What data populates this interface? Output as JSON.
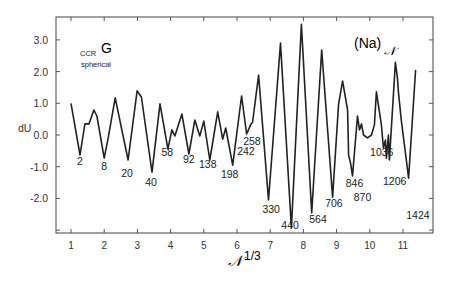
{
  "chart_data": {
    "type": "line",
    "title": "",
    "xlabel": "N^(1/3)",
    "xlabel_main": "𝒩",
    "xlabel_sup": "1/3",
    "ylabel": "dU",
    "xlim": [
      0.55,
      11.9
    ],
    "ylim": [
      -3.1,
      3.7
    ],
    "grid": false,
    "x_ticks": [
      1,
      2,
      3,
      4,
      5,
      6,
      7,
      8,
      9,
      10,
      11
    ],
    "x_tick_labels": [
      "1",
      "2",
      "3",
      "4",
      "5",
      "6",
      "7",
      "8",
      "9",
      "10",
      "11"
    ],
    "y_ticks": [
      3.0,
      2.0,
      1.0,
      0.0,
      -1.0,
      -2.0
    ],
    "y_tick_labels": [
      "3.0",
      "2.0",
      "1.0",
      "0.0",
      "-1.0",
      "-2.0"
    ],
    "annotations": {
      "model_main": "G",
      "model_sub": "CCR",
      "model_line2": "spherical",
      "system_main": "(Na)",
      "system_sub": "𝒩"
    },
    "series": [
      {
        "name": "dU",
        "x": [
          1.0,
          1.27,
          1.42,
          1.54,
          1.69,
          1.78,
          2.0,
          2.12,
          2.33,
          2.72,
          2.99,
          3.12,
          3.44,
          3.68,
          3.92,
          4.04,
          4.13,
          4.34,
          4.55,
          4.73,
          4.88,
          5.0,
          5.18,
          5.42,
          5.57,
          5.66,
          5.87,
          6.14,
          6.29,
          6.41,
          6.47,
          6.65,
          6.95,
          7.31,
          7.64,
          7.94,
          8.25,
          8.55,
          8.88,
          9.06,
          9.18,
          9.33,
          9.36,
          9.42,
          9.48,
          9.63,
          9.69,
          9.75,
          9.81,
          9.93,
          10.05,
          10.14,
          10.2,
          10.35,
          10.41,
          10.47,
          10.5,
          10.56,
          10.59,
          10.77,
          10.83,
          10.86,
          10.95,
          11.17,
          11.38
        ],
        "y": [
          1.0,
          -0.63,
          0.35,
          0.35,
          0.79,
          0.6,
          -0.73,
          -0.09,
          1.17,
          -0.79,
          1.39,
          1.2,
          -1.17,
          0.98,
          -0.44,
          0.16,
          -0.03,
          0.66,
          -0.6,
          0.47,
          -0.03,
          0.44,
          -0.79,
          0.73,
          -0.13,
          0.22,
          -0.95,
          1.23,
          0.03,
          0.32,
          0.41,
          1.89,
          -2.05,
          2.9,
          -2.93,
          3.49,
          -2.46,
          2.68,
          -1.96,
          0.98,
          1.7,
          0.79,
          -0.63,
          -0.88,
          -1.29,
          0.6,
          0.16,
          0.35,
          0.0,
          -0.09,
          0.0,
          0.32,
          1.36,
          0.32,
          -0.41,
          -0.16,
          -0.73,
          0.0,
          -0.79,
          2.29,
          1.8,
          1.36,
          0.47,
          -1.36,
          2.05
        ]
      }
    ],
    "magic_numbers": [
      {
        "label": "2",
        "x": 1.27,
        "y": -0.95
      },
      {
        "label": "8",
        "x": 2.0,
        "y": -1.1
      },
      {
        "label": "20",
        "x": 2.69,
        "y": -1.33
      },
      {
        "label": "40",
        "x": 3.41,
        "y": -1.6
      },
      {
        "label": "58",
        "x": 3.9,
        "y": -0.66
      },
      {
        "label": "92",
        "x": 4.55,
        "y": -0.88
      },
      {
        "label": "138",
        "x": 5.12,
        "y": -1.04
      },
      {
        "label": "198",
        "x": 5.78,
        "y": -1.36
      },
      {
        "label": "242",
        "x": 6.27,
        "y": -0.63
      },
      {
        "label": "258",
        "x": 6.45,
        "y": -0.32
      },
      {
        "label": "330",
        "x": 7.03,
        "y": -2.46
      },
      {
        "label": "440",
        "x": 7.6,
        "y": -2.96
      },
      {
        "label": "564",
        "x": 8.44,
        "y": -2.78
      },
      {
        "label": "706",
        "x": 8.92,
        "y": -2.27
      },
      {
        "label": "846",
        "x": 9.54,
        "y": -1.64
      },
      {
        "label": "870",
        "x": 9.78,
        "y": -2.08
      },
      {
        "label": "1036",
        "x": 10.36,
        "y": -0.66
      },
      {
        "label": "1206",
        "x": 10.75,
        "y": -1.58
      },
      {
        "label": "1424",
        "x": 11.45,
        "y": -2.65
      }
    ]
  },
  "ui": {
    "colors": {
      "line": "#222222",
      "axis": "#555555",
      "text": "#222222",
      "background": "#ffffff"
    }
  }
}
